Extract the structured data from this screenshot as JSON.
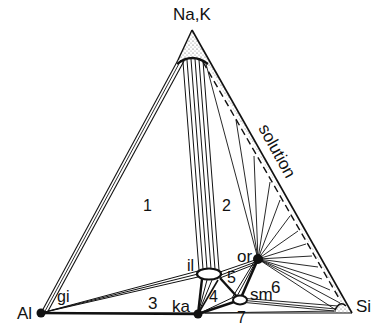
{
  "diagram": {
    "type": "ternary phase diagram",
    "vertices": {
      "top": "Na,K",
      "left": "Al",
      "right": "Si"
    },
    "phases": {
      "gibbsite": "gi",
      "kaolinite": "ka",
      "illite": "il",
      "orthoclase": "or",
      "smectite": "sm"
    },
    "solution_label": "solution",
    "regions": [
      "1",
      "2",
      "3",
      "4",
      "5",
      "6",
      "7"
    ],
    "colors": {
      "line": "#111111",
      "background": "#ffffff",
      "stipple": "#555555"
    }
  }
}
